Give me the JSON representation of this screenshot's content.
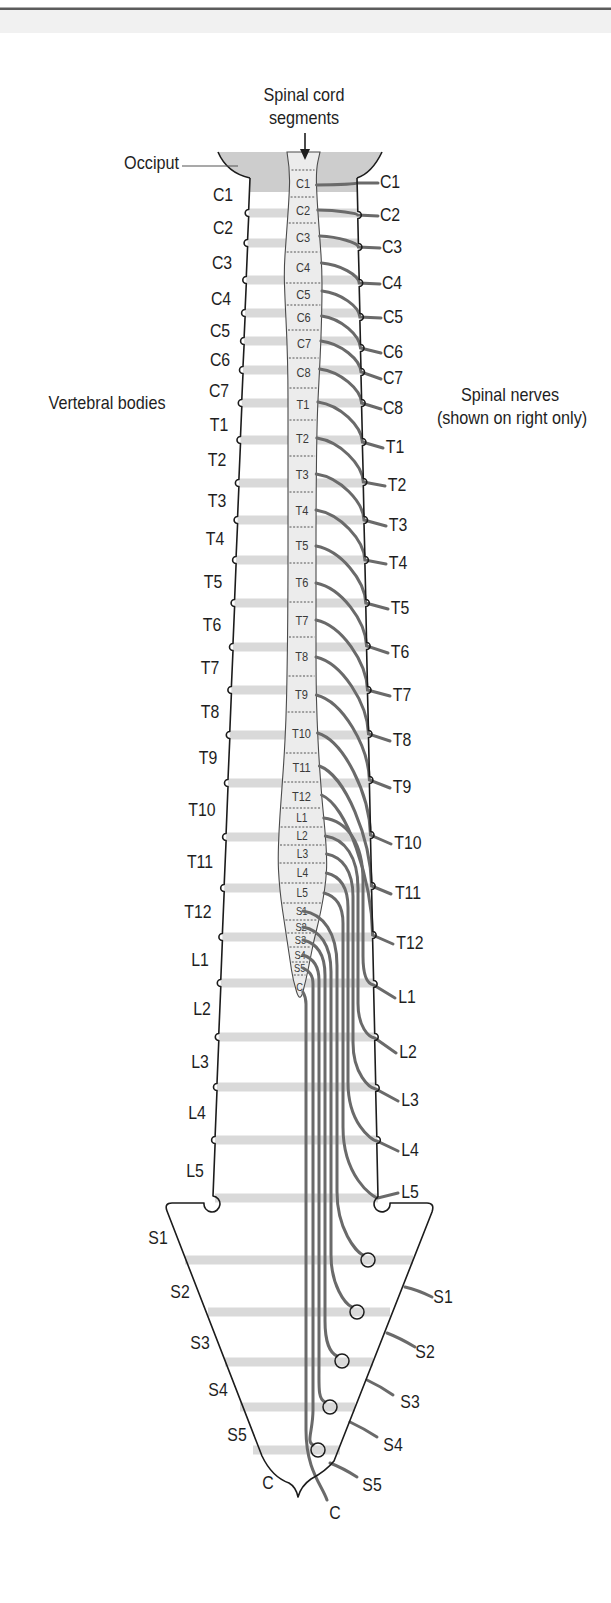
{
  "figure": {
    "title_line1": "Spinal cord",
    "title_line2": "segments",
    "occiput_label": "Occiput",
    "vertebral_bodies_label": "Vertebral bodies",
    "spinal_nerves_line1": "Spinal nerves",
    "spinal_nerves_line2": "(shown on right only)"
  },
  "vertebral_bodies": [
    "C1",
    "C2",
    "C3",
    "C4",
    "C5",
    "C6",
    "C7",
    "T1",
    "T2",
    "T3",
    "T4",
    "T5",
    "T6",
    "T7",
    "T8",
    "T9",
    "T10",
    "T11",
    "T12",
    "L1",
    "L2",
    "L3",
    "L4",
    "L5"
  ],
  "sacrum_coccyx": [
    "S1",
    "S2",
    "S3",
    "S4",
    "S5",
    "C"
  ],
  "cord_segments": [
    "C1",
    "C2",
    "C3",
    "C4",
    "C5",
    "C6",
    "C7",
    "C8",
    "T1",
    "T2",
    "T3",
    "T4",
    "T5",
    "T6",
    "T7",
    "T8",
    "T9",
    "T10",
    "T11",
    "T12",
    "L1",
    "L2",
    "L3",
    "L4",
    "L5",
    "S1",
    "S2",
    "S3",
    "S4",
    "S5",
    "C"
  ],
  "spinal_nerves": [
    "C1",
    "C2",
    "C3",
    "C4",
    "C5",
    "C6",
    "C7",
    "C8",
    "T1",
    "T2",
    "T3",
    "T4",
    "T5",
    "T6",
    "T7",
    "T8",
    "T9",
    "T10",
    "T11",
    "T12",
    "L1",
    "L2",
    "L3",
    "L4",
    "L5",
    "S1",
    "S2",
    "S3",
    "S4",
    "S5",
    "C"
  ],
  "colors": {
    "outline": "#1c1c1c",
    "nerve": "#6a6a6a",
    "disc_band": "#d9d9d9",
    "cord_fill": "#ececec",
    "occiput_fill": "#cdcdcd",
    "text": "#1e1e1e",
    "segment_text": "#3a3a3a",
    "top_rule": "#5c5c5c"
  }
}
